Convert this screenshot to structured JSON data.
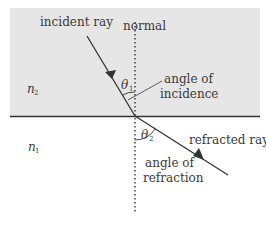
{
  "diagram": {
    "colors": {
      "upper_medium": "#e6e6e6",
      "lower_medium": "#ffffff",
      "lines": "#333333"
    },
    "labels": {
      "incident_ray": "incident ray",
      "normal": "normal",
      "angle_of_incidence_line1": "angle of",
      "angle_of_incidence_line2": "incidence",
      "refracted_ray": "refracted ray",
      "angle_of_refraction_line1": "angle of",
      "angle_of_refraction_line2": "refraction"
    },
    "symbols": {
      "theta1": "θ",
      "theta1_sub": "1",
      "theta2": "θ",
      "theta2_sub": "2",
      "n2": "n",
      "n2_sub": "2",
      "n1": "n",
      "n1_sub": "1"
    }
  }
}
